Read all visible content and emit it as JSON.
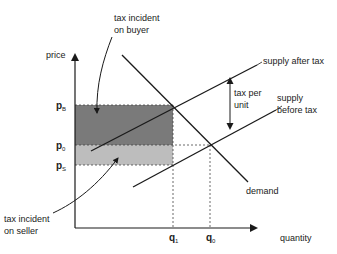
{
  "diagram": {
    "title": "",
    "axes": {
      "y_label": "price",
      "x_label": "quantity"
    },
    "price_levels": [
      {
        "id": "pB",
        "base": "p",
        "sub": "B"
      },
      {
        "id": "p0",
        "base": "p",
        "sub": "0"
      },
      {
        "id": "pS",
        "base": "p",
        "sub": "S"
      }
    ],
    "quantity_levels": [
      {
        "id": "q1",
        "base": "q",
        "sub": "1"
      },
      {
        "id": "q0",
        "base": "q",
        "sub": "0"
      }
    ],
    "curves": {
      "supply_after_tax": "supply after tax",
      "supply_before_tax_line1": "supply",
      "supply_before_tax_line2": "before tax",
      "demand": "demand"
    },
    "annotations": {
      "tax_per_unit_line1": "tax per",
      "tax_per_unit_line2": "unit",
      "buyer_line1": "tax incident",
      "buyer_line2": "on buyer",
      "seller_line1": "tax incident",
      "seller_line2": "on seller"
    },
    "colors": {
      "buyer_area": "#7a7a7a",
      "seller_area": "#bdbdbd",
      "line": "#1a1a1a"
    }
  }
}
